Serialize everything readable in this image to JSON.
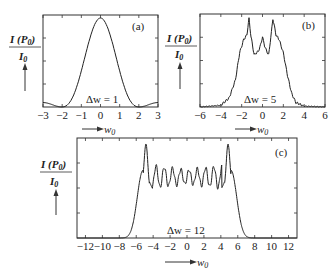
{
  "chart_data": [
    {
      "type": "line",
      "panel": "(a)",
      "title": "",
      "annotation": "Δw = 1",
      "xlabel": "w0",
      "ylabel": "I(P0)/I0",
      "xlim": [
        -3,
        3
      ],
      "xticks": [
        -3,
        -2,
        -1,
        0,
        1,
        2,
        3
      ],
      "ylim": [
        0,
        1
      ],
      "grid": false,
      "description": "Single central peak (sinc²-like) with small side lobes, minima near ±2",
      "x": [
        -3,
        -2.5,
        -2,
        -1.5,
        -1,
        -0.5,
        0,
        0.5,
        1,
        1.5,
        2,
        2.5,
        3
      ],
      "values": [
        0.045,
        0.03,
        0.0,
        0.17,
        0.5,
        0.87,
        1.0,
        0.87,
        0.5,
        0.17,
        0.0,
        0.03,
        0.045
      ]
    },
    {
      "type": "line",
      "panel": "(b)",
      "annotation": "Δw = 5",
      "xlabel": "w0",
      "ylabel": "I(P0)/I0",
      "xlim": [
        -6,
        6
      ],
      "xticks": [
        -6,
        -4,
        -2,
        0,
        2,
        4,
        6
      ],
      "ylim": [
        0,
        1
      ],
      "grid": false,
      "description": "Flat-topped profile with two sharp outer peaks near ±1.3 and a smaller central peak",
      "x": [
        -6,
        -4,
        -3.2,
        -2.6,
        -2.2,
        -1.8,
        -1.5,
        -1.3,
        -1.1,
        -0.8,
        -0.4,
        -0.2,
        0,
        0.2,
        0.4,
        0.6,
        0.8,
        1.0,
        1.3,
        1.6,
        2.0,
        2.4,
        2.8,
        3.2,
        4,
        6
      ],
      "values": [
        0.0,
        0.02,
        0.1,
        0.3,
        0.6,
        0.75,
        0.8,
        0.98,
        0.78,
        0.58,
        0.62,
        0.68,
        0.78,
        0.68,
        0.62,
        0.58,
        0.78,
        0.98,
        0.8,
        0.75,
        0.6,
        0.35,
        0.15,
        0.05,
        0.01,
        0.0
      ]
    },
    {
      "type": "line",
      "panel": "(c)",
      "annotation": "Δw = 12",
      "xlabel": "w0",
      "ylabel": "I(P0)/I0",
      "xlim": [
        -13,
        13
      ],
      "xticks": [
        -12,
        -10,
        -8,
        -6,
        -4,
        -2,
        0,
        2,
        4,
        6,
        8,
        10,
        12
      ],
      "ylim": [
        0,
        1
      ],
      "grid": false,
      "description": "Wide flat top between ±4.7 with dense rapid oscillations and two edge peaks near ±4.8; steep falls to zero near ±7",
      "edge_peaks": [
        -4.8,
        4.8
      ],
      "plateau_mean": 0.65,
      "plateau_oscillation_amplitude": 0.12
    }
  ],
  "labels": {
    "ylabel_num": "I (P",
    "ylabel_sub": "0",
    "ylabel_close": ")",
    "ylabel_den": "I",
    "ylabel_den_sub": "0",
    "xlabel": "w",
    "xlabel_sub": "0",
    "panel_a": "(a)",
    "panel_b": "(b)",
    "panel_c": "(c)",
    "ann_a": "Δw = 1",
    "ann_b": "Δw = 5",
    "ann_c": "Δw = 12"
  }
}
